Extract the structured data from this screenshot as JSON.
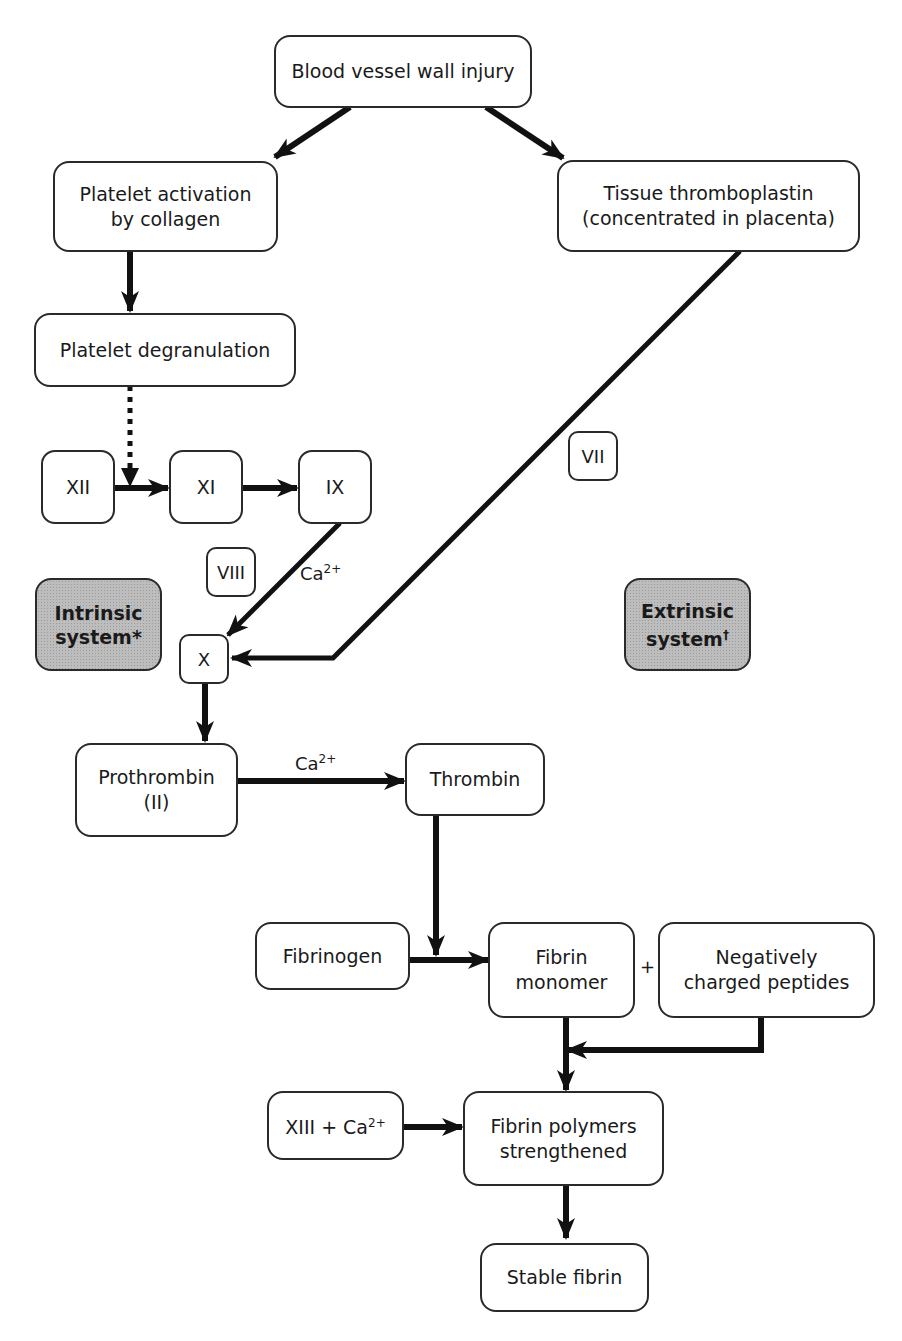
{
  "diagram": {
    "nodes": {
      "injury": {
        "lines": [
          "Blood vessel wall injury"
        ]
      },
      "platelet_activation": {
        "lines": [
          "Platelet activation",
          "by collagen"
        ]
      },
      "tissue_thromboplastin": {
        "lines": [
          "Tissue thromboplastin",
          "(concentrated in placenta)"
        ]
      },
      "platelet_degranulation": {
        "lines": [
          "Platelet degranulation"
        ]
      },
      "xii": {
        "lines": [
          "XII"
        ]
      },
      "xi": {
        "lines": [
          "XI"
        ]
      },
      "ix": {
        "lines": [
          "IX"
        ]
      },
      "vii": {
        "lines": [
          "VII"
        ]
      },
      "viii": {
        "lines": [
          "VIII"
        ]
      },
      "x": {
        "lines": [
          "X"
        ]
      },
      "intrinsic": {
        "lines": [
          "Intrinsic",
          "system"
        ],
        "mark": "*"
      },
      "extrinsic": {
        "lines": [
          "Extrinsic",
          "system"
        ],
        "mark": "†"
      },
      "prothrombin": {
        "lines": [
          "Prothrombin",
          "(II)"
        ]
      },
      "thrombin": {
        "lines": [
          "Thrombin"
        ]
      },
      "fibrinogen": {
        "lines": [
          "Fibrinogen"
        ]
      },
      "fibrin_monomer": {
        "lines": [
          "Fibrin",
          "monomer"
        ]
      },
      "negative_peptides": {
        "lines": [
          "Negatively",
          "charged peptides"
        ]
      },
      "xiii_ca": {
        "text": "XIII + Ca",
        "sup": "2+"
      },
      "fibrin_polymers": {
        "lines": [
          "Fibrin polymers",
          "strengthened"
        ]
      },
      "stable_fibrin": {
        "lines": [
          "Stable fibrin"
        ]
      }
    },
    "labels": {
      "ca_ix_x": {
        "text": "Ca",
        "sup": "2+"
      },
      "ca_prothrombin": {
        "text": "Ca",
        "sup": "2+"
      },
      "plus": "+"
    },
    "colors": {
      "stroke": "#111111",
      "box_border": "#2a2a2a",
      "shaded_fill": "#bdbdbd"
    }
  }
}
